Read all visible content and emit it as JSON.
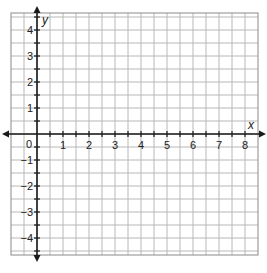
{
  "chart_data": {
    "type": "coordinate-grid",
    "title": "",
    "xlabel": "x",
    "ylabel": "y",
    "x_ticks": [
      "0",
      "1",
      "2",
      "3",
      "4",
      "5",
      "6",
      "7",
      "8"
    ],
    "y_ticks": [
      "4",
      "3",
      "2",
      "1",
      "-1",
      "-2",
      "-3",
      "-4"
    ],
    "xlim": [
      -1,
      8.5
    ],
    "ylim": [
      -4.6,
      4.6
    ],
    "grid": true,
    "grid_step": 0.5,
    "series": []
  },
  "labels": {
    "x_axis": "x",
    "y_axis": "y",
    "origin": "0",
    "x": [
      "1",
      "2",
      "3",
      "4",
      "5",
      "6",
      "7",
      "8"
    ],
    "y_pos": [
      "1",
      "2",
      "3",
      "4"
    ],
    "y_neg": [
      "−1",
      "−2",
      "−3",
      "−4"
    ]
  },
  "colors": {
    "grid": "#b8b8b8",
    "border": "#8a8a8a",
    "axis": "#1a1a1a",
    "text": "#222222"
  }
}
